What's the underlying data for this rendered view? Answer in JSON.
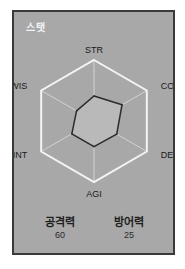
{
  "panel": {
    "title": "스탯"
  },
  "chart_data": {
    "type": "radar",
    "axes": [
      "STR",
      "CON",
      "DEX",
      "AGI",
      "INT",
      "WIS"
    ],
    "values": [
      0.41,
      0.53,
      0.43,
      0.42,
      0.42,
      0.33
    ],
    "range": [
      0,
      1
    ],
    "grid": true,
    "colors": {
      "grid": "#f4f4f4",
      "fill": "#b9b9b9",
      "outline": "#2b2b2b"
    }
  },
  "summary": {
    "attack_label": "공격력",
    "attack_value": "60",
    "defense_label": "방어력",
    "defense_value": "25"
  }
}
